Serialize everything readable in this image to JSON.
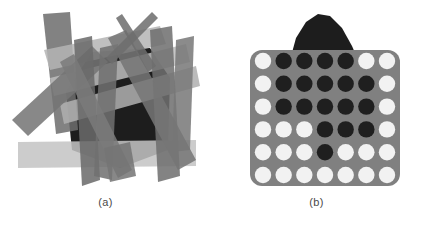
{
  "figure": {
    "background": "#ffffff",
    "caption_color": "#4a4a4a"
  },
  "panels": [
    {
      "id": "panel-a",
      "caption": "(a)",
      "description": "overlapping translucent gray quadrilateral strips over a dark irregular region",
      "palette": {
        "dark_region": "#1d1d1d",
        "strip_dark": "#6b6b6b",
        "strip_mid": "#7e7e7e",
        "strip_light": "#a9a9a9",
        "strip_pale": "#c2c2c2",
        "band": "#bdbdbd"
      },
      "shapes": [
        {
          "name": "dark-blob",
          "fill": "#1d1d1d",
          "points": "92,52 150,48 170,78 168,150 120,168 72,150 66,92"
        },
        {
          "name": "band-horizontal-lower",
          "fill": "#c4c4c4",
          "points": "18,142 196,140 196,166 18,168"
        },
        {
          "name": "strip-vertical-left-dark",
          "fill": "#6e6e6e",
          "points": "43,14 70,12 78,130 56,134"
        },
        {
          "name": "strip-diag-upper-pale",
          "fill": "#b5b5b5",
          "points": "44,50 160,26 166,44 50,70"
        },
        {
          "name": "strip-diag-upper-pale2",
          "fill": "#bdbdbd",
          "points": "50,78 186,44 190,62 54,96"
        },
        {
          "name": "strip-diag-mid-pale",
          "fill": "#b0b0b0",
          "points": "60,104 196,66 200,86 64,124"
        },
        {
          "name": "strip-diag-lowleft-dark",
          "fill": "#757575",
          "points": "12,120 92,46 108,62 28,136"
        },
        {
          "name": "strip-vertical-midleft",
          "fill": "#6a6a6a",
          "points": "74,40 92,36 100,180 82,186"
        },
        {
          "name": "strip-vertical-mid",
          "fill": "#707070",
          "points": "100,48 118,44 112,180 94,176"
        },
        {
          "name": "strip-tall-right-dark",
          "fill": "#6f6f6f",
          "points": "150,30 172,26 180,176 158,182"
        },
        {
          "name": "strip-vertical-rightmost",
          "fill": "#787878",
          "points": "176,40 194,36 190,150 172,152"
        },
        {
          "name": "strip-diag-cross-down",
          "fill": "#767676",
          "points": "108,38 126,30 196,160 178,170"
        },
        {
          "name": "strip-needle-up-left",
          "fill": "#6d6d6d",
          "points": "116,18 122,14 156,66 148,72"
        },
        {
          "name": "strip-needle-up-right",
          "fill": "#6d6d6d",
          "points": "152,12 158,18 112,64 106,58"
        },
        {
          "name": "strip-diag-down-left",
          "fill": "#7a7a7a",
          "points": "60,62 74,54 132,170 118,178"
        },
        {
          "name": "strip-bottom-wedge",
          "fill": "#747474",
          "points": "104,148 130,142 136,176 110,182"
        }
      ]
    },
    {
      "id": "panel-b",
      "caption": "(b)",
      "description": "rounded square gray panel with a 7 by 6 grid of circles, dark blob peeking above",
      "palette": {
        "panel_fill": "#808080",
        "panel_radius": 12,
        "circle_on": "#f2f2f2",
        "circle_off": "#1f1f1f",
        "blob_fill": "#1d1d1d"
      },
      "blob": {
        "name": "dark-blob-behind-panel",
        "points": "290,60 296,38 306,22 318,14 330,16 342,28 352,46 358,60"
      },
      "panel_rect": {
        "x": 250,
        "y": 50,
        "width": 150,
        "height": 136
      },
      "grid": {
        "columns": 7,
        "rows": 6,
        "circle_radius": 8.2,
        "states": [
          [
            "on",
            "off",
            "off",
            "off",
            "off",
            "on",
            "on"
          ],
          [
            "on",
            "off",
            "off",
            "off",
            "off",
            "off",
            "on"
          ],
          [
            "on",
            "off",
            "off",
            "off",
            "off",
            "off",
            "on"
          ],
          [
            "on",
            "on",
            "on",
            "off",
            "off",
            "off",
            "on"
          ],
          [
            "on",
            "on",
            "on",
            "off",
            "on",
            "on",
            "on"
          ],
          [
            "on",
            "on",
            "on",
            "on",
            "on",
            "on",
            "on"
          ]
        ]
      }
    }
  ]
}
